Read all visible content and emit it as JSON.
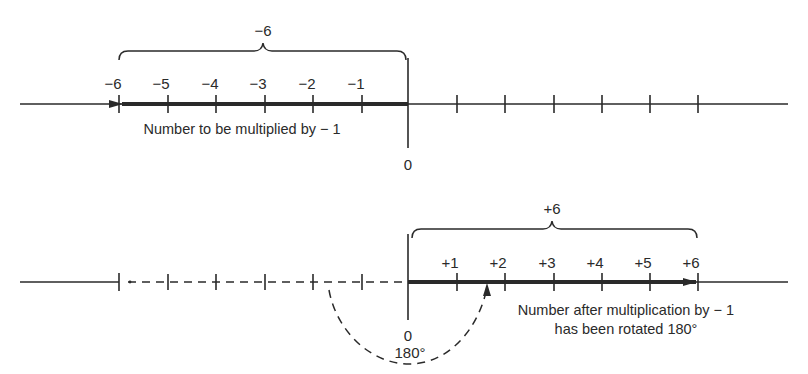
{
  "figure": {
    "top_line": {
      "brace_label": "−6",
      "tick_labels": [
        "−6",
        "−5",
        "−4",
        "−3",
        "−2",
        "−1"
      ],
      "zero_label": "0",
      "caption": "Number to be multiplied by − 1",
      "unlabeled_positive_ticks": 6
    },
    "bottom_line": {
      "brace_label": "+6",
      "tick_labels": [
        "+1",
        "+2",
        "+3",
        "+4",
        "+5",
        "+6"
      ],
      "zero_label": "0",
      "rotation_label": "180°",
      "caption_line1": "Number after multiplication by − 1",
      "caption_line2": "has been rotated 180°",
      "dashed_negative_ticks": 6
    },
    "colors": {
      "ink": "#2a2a2a",
      "background": "#ffffff"
    }
  }
}
